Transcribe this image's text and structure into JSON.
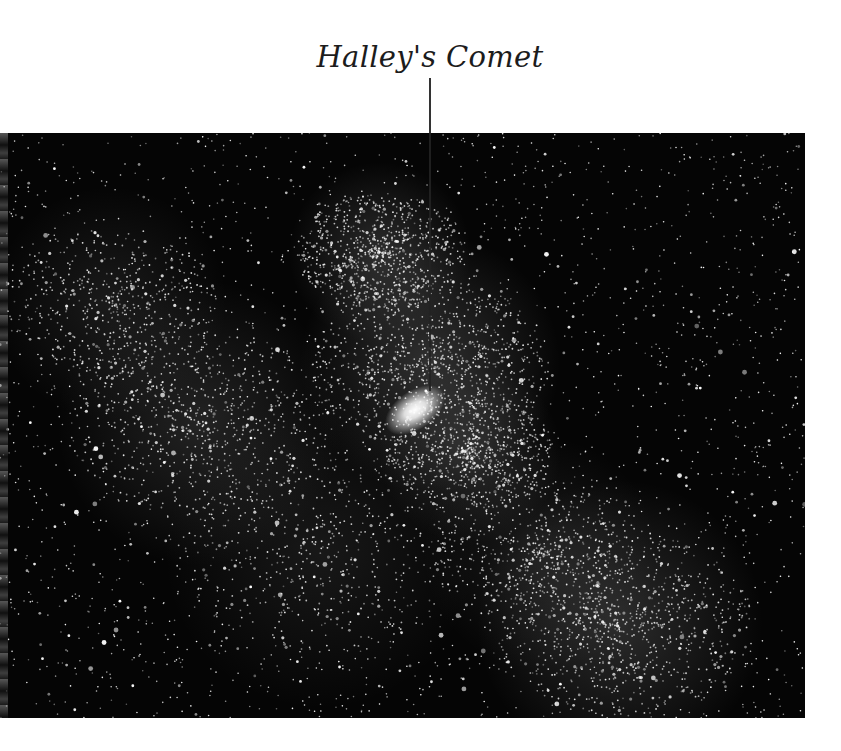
{
  "figure": {
    "caption": "Halley's Comet",
    "photo": {
      "subject": "starfield with Milky Way star clouds",
      "background_color": "#050505",
      "star_color": "#ffffff",
      "nebula_color": "#c8c8c8"
    },
    "comet": {
      "label": "Halley's Comet",
      "head_position": [
        415,
        410
      ],
      "leader_line": {
        "x": 430,
        "y_start": 78,
        "y_end": 391
      }
    }
  }
}
